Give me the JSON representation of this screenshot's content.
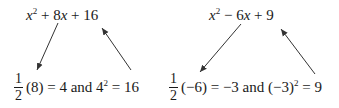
{
  "left": {
    "expression": {
      "var": "x",
      "exp": "2",
      "rest_op1": " + 8",
      "var2": "x",
      "rest": " + 16"
    },
    "fraction": {
      "num": "1",
      "den": "2"
    },
    "result": {
      "pre": "(8) = 4 and 4",
      "exp": "2",
      "post": " = 16"
    }
  },
  "right": {
    "expression": {
      "var": "x",
      "exp": "2",
      "rest_op1": " − 6",
      "var2": "x",
      "rest": " + 9"
    },
    "fraction": {
      "num": "1",
      "den": "2"
    },
    "result": {
      "pre": "(−6) = −3 and (−3)",
      "exp": "2",
      "post": " = 9"
    }
  },
  "arrows": [
    {
      "name": "left-down-arrow",
      "from": [
        58,
        23
      ],
      "to": [
        37,
        70
      ]
    },
    {
      "name": "left-up-arrow",
      "from": [
        131,
        70
      ],
      "to": [
        102,
        28
      ]
    },
    {
      "name": "right-down-arrow",
      "from": [
        241,
        24
      ],
      "to": [
        200,
        72
      ]
    },
    {
      "name": "right-up-arrow",
      "from": [
        315,
        74
      ],
      "to": [
        281,
        29
      ]
    }
  ]
}
